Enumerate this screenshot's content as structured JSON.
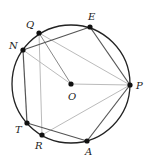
{
  "diagram": {
    "type": "inscribed-polygon-in-circle",
    "circle": {
      "cx": 71,
      "cy": 84,
      "r": 59,
      "stroke": "#222222"
    },
    "points": {
      "O": {
        "x": 71,
        "y": 84,
        "label": "O",
        "lx": 68,
        "ly": 100
      },
      "P": {
        "x": 130,
        "y": 85,
        "label": "P",
        "lx": 136,
        "ly": 89
      },
      "E": {
        "x": 90,
        "y": 27,
        "label": "E",
        "lx": 88,
        "ly": 20
      },
      "Q": {
        "x": 39,
        "y": 33,
        "label": "Q",
        "lx": 26,
        "ly": 28
      },
      "N": {
        "x": 23,
        "y": 50,
        "label": "N",
        "lx": 9,
        "ly": 49
      },
      "T": {
        "x": 27,
        "y": 123,
        "label": "T",
        "lx": 15,
        "ly": 133
      },
      "R": {
        "x": 42,
        "y": 135,
        "label": "R",
        "lx": 35,
        "ly": 149
      },
      "A": {
        "x": 87,
        "y": 141,
        "label": "A",
        "lx": 85,
        "ly": 155
      }
    },
    "dark_segments": [
      [
        "N",
        "E"
      ],
      [
        "E",
        "P"
      ],
      [
        "P",
        "A"
      ],
      [
        "A",
        "T"
      ],
      [
        "T",
        "N"
      ]
    ],
    "light_segments": [
      [
        "Q",
        "O"
      ],
      [
        "N",
        "O"
      ],
      [
        "O",
        "P"
      ],
      [
        "Q",
        "P"
      ],
      [
        "Q",
        "R"
      ],
      [
        "R",
        "P"
      ]
    ],
    "colors": {
      "dark_line": "#555555",
      "light_line": "#bbbbbb",
      "medium_line": "#888888",
      "point": "#111111"
    }
  }
}
